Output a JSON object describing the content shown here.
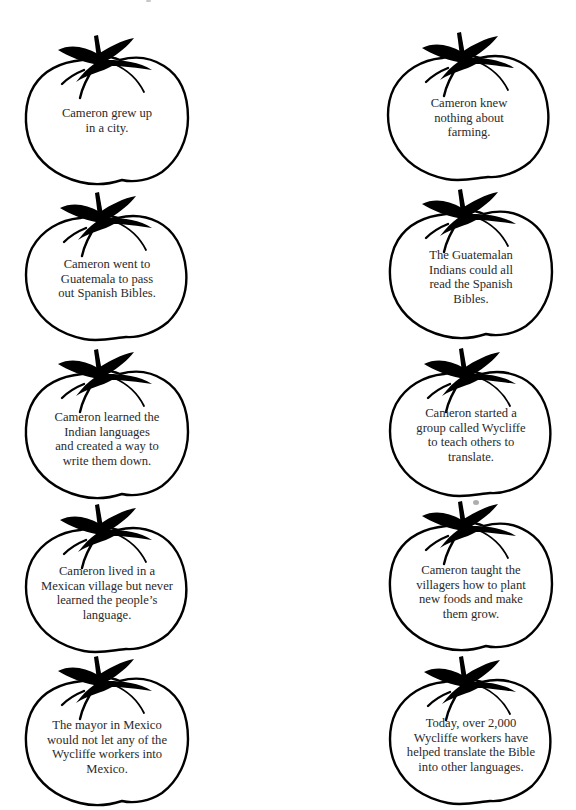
{
  "worksheet": {
    "colors": {
      "outline": "#000000",
      "text": "#2a2a2a",
      "background": "#ffffff",
      "smudge": "#9a9a9a"
    },
    "tomatoes": [
      {
        "id": "t1",
        "column": "left",
        "row": 1,
        "lines": [
          "Cameron grew up",
          "in a city."
        ]
      },
      {
        "id": "t2",
        "column": "right",
        "row": 1,
        "lines": [
          "Cameron knew",
          "nothing about",
          "farming."
        ]
      },
      {
        "id": "t3",
        "column": "left",
        "row": 2,
        "lines": [
          "Cameron went to",
          "Guatemala to pass",
          "out Spanish Bibles."
        ]
      },
      {
        "id": "t4",
        "column": "right",
        "row": 2,
        "lines": [
          "The Guatemalan",
          "Indians could all",
          "read the Spanish",
          "Bibles."
        ]
      },
      {
        "id": "t5",
        "column": "left",
        "row": 3,
        "lines": [
          "Cameron learned the",
          "Indian languages",
          "and created a way to",
          "write them down."
        ]
      },
      {
        "id": "t6",
        "column": "right",
        "row": 3,
        "lines": [
          "Cameron started a",
          "group called Wycliffe",
          "to teach others to",
          "translate."
        ]
      },
      {
        "id": "t7",
        "column": "left",
        "row": 4,
        "lines": [
          "Cameron lived in a",
          "Mexican village but never",
          "learned the people’s",
          "language."
        ]
      },
      {
        "id": "t8",
        "column": "right",
        "row": 4,
        "lines": [
          "Cameron taught the",
          "villagers how to plant",
          "new foods and make",
          "them grow."
        ]
      },
      {
        "id": "t9",
        "column": "left",
        "row": 5,
        "lines": [
          "The mayor in Mexico",
          "would not let any of the",
          "Wycliffe workers into",
          "Mexico."
        ]
      },
      {
        "id": "t10",
        "column": "right",
        "row": 5,
        "lines": [
          "Today, over 2,000",
          "Wycliffe workers have",
          "helped translate the Bible",
          "into other languages."
        ]
      }
    ],
    "icons": {
      "tomato_outline": "tomato-outline-icon",
      "stem": "tomato-stem-icon"
    }
  }
}
